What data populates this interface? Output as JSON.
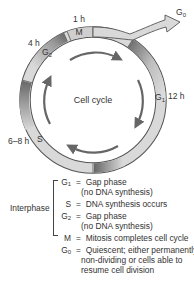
{
  "diagram": {
    "title": "Cell cycle",
    "center_label": "Cell cycle",
    "phases": [
      {
        "key": "M",
        "label": "M",
        "duration": "1 h"
      },
      {
        "key": "G1",
        "label": "G",
        "sub": "1",
        "duration": "12 h"
      },
      {
        "key": "S",
        "label": "S",
        "duration": "6–8 h"
      },
      {
        "key": "G2",
        "label": "G",
        "sub": "2",
        "duration": "4 h"
      }
    ],
    "exit": {
      "label": "G",
      "sub": "0"
    },
    "colors": {
      "ring_light": "#d9d9d9",
      "ring_dark": "#7a7a7a",
      "ring_stroke": "#555555",
      "arrow": "#666666"
    }
  },
  "legend": {
    "group_label": "Interphase",
    "items": [
      {
        "key": "G",
        "sub": "1",
        "eq": "=",
        "text": "Gap phase",
        "text2": "(no DNA synthesis)"
      },
      {
        "key": "S",
        "sub": "",
        "eq": "=",
        "text": "DNA synthesis occurs"
      },
      {
        "key": "G",
        "sub": "2",
        "eq": "=",
        "text": "Gap phase",
        "text2": "(no DNA synthesis)"
      },
      {
        "key": "M",
        "sub": "",
        "eq": "=",
        "text": "Mitosis completes cell cycle"
      },
      {
        "key": "G",
        "sub": "0",
        "eq": "=",
        "text": "Quiescent; either permanently",
        "text2": "non-dividing or cells able to",
        "text3": "resume cell division"
      }
    ]
  }
}
